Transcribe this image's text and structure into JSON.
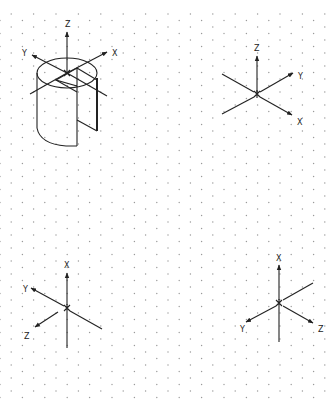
{
  "diagram": {
    "grid": {
      "type": "isometric-dot-grid",
      "dot_color": "#9a9a9a"
    },
    "figures": [
      {
        "name": "cylinder-with-slot",
        "origin": [
          67,
          73
        ],
        "axes": {
          "z": {
            "label": "Z"
          },
          "y": {
            "label": "Y"
          },
          "x": {
            "label": "X"
          }
        }
      },
      {
        "name": "triad-top-right",
        "origin": [
          257,
          94
        ],
        "axes": {
          "z": {
            "label": "Z"
          },
          "y": {
            "label": "Y"
          },
          "x": {
            "label": "X"
          }
        }
      },
      {
        "name": "triad-bottom-left",
        "origin": [
          67,
          308
        ],
        "axes": {
          "x": {
            "label": "X"
          },
          "y": {
            "label": "Y"
          },
          "z": {
            "label": "Z"
          }
        }
      },
      {
        "name": "triad-bottom-right",
        "origin": [
          279,
          303
        ],
        "axes": {
          "x": {
            "label": "X"
          },
          "y": {
            "label": "Y"
          },
          "z": {
            "label": "Z"
          }
        }
      }
    ]
  }
}
